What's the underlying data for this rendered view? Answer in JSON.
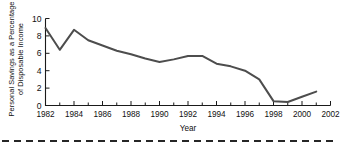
{
  "figure": {
    "ylabel_line1": "Personal Savings as a Percentage",
    "ylabel_line2": "of Disposable Income",
    "xlabel": "Year"
  },
  "chart_data": {
    "type": "line",
    "title": "",
    "xlabel": "Year",
    "ylabel": "Personal Savings as a Percentage of Disposable Income",
    "xlim": [
      1982,
      2002
    ],
    "ylim": [
      0,
      10
    ],
    "grid": false,
    "legend": null,
    "line_color": "#4d4d4d",
    "xticks": [
      1982,
      1984,
      1986,
      1988,
      1990,
      1992,
      1994,
      1996,
      1998,
      2000,
      2002
    ],
    "xtick_labels": [
      "1982",
      "1984",
      "1986",
      "1988",
      "1990",
      "1992",
      "1994",
      "1996",
      "1998",
      "2000",
      "2002"
    ],
    "minor_xticks": [
      1983,
      1985,
      1987,
      1989,
      1991,
      1993,
      1995,
      1997,
      1999,
      2001
    ],
    "yticks": [
      0,
      2,
      4,
      6,
      8,
      10
    ],
    "ytick_labels": [
      "0",
      "2",
      "4",
      "6",
      "8",
      "10"
    ],
    "x": [
      1982,
      1983,
      1984,
      1985,
      1986,
      1987,
      1988,
      1989,
      1990,
      1991,
      1992,
      1993,
      1994,
      1995,
      1996,
      1997,
      1998,
      1999,
      2000,
      2001
    ],
    "values": [
      8.9,
      6.4,
      8.7,
      7.5,
      6.9,
      6.3,
      5.9,
      5.4,
      5.0,
      5.3,
      5.7,
      5.7,
      4.8,
      4.5,
      4.0,
      3.0,
      0.5,
      0.4,
      1.0,
      1.6
    ]
  },
  "separator": {
    "style": "dashed-rule"
  }
}
